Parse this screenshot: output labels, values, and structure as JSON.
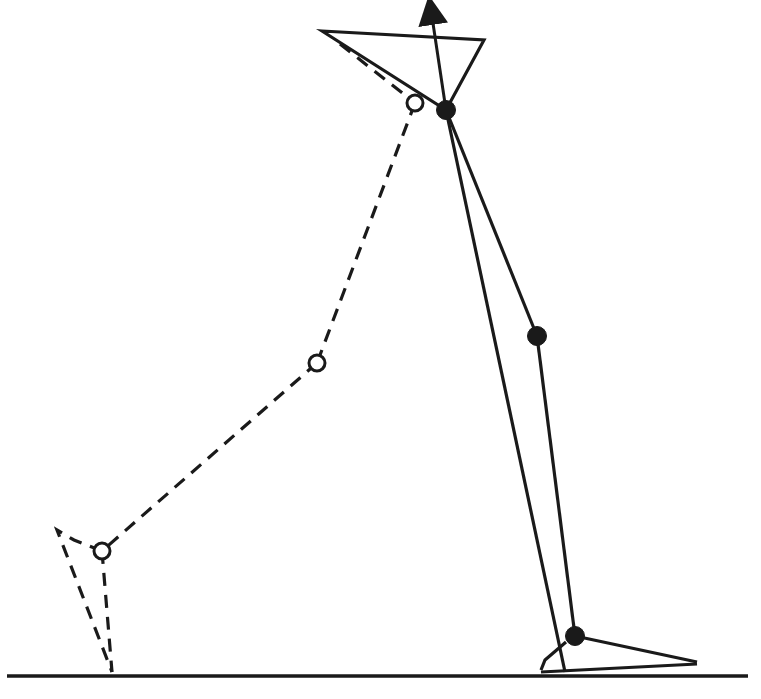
{
  "diagram": {
    "title": "",
    "colors": {
      "stroke": "#1a1a1a",
      "background": "#ffffff",
      "open_joint_fill": "#ffffff"
    },
    "ground": {
      "x1": 7,
      "y1": 676,
      "x2": 748,
      "y2": 676
    },
    "pelvis": {
      "points": [
        [
          322,
          31
        ],
        [
          484,
          40
        ],
        [
          446,
          110
        ]
      ],
      "arrow": {
        "from": [
          446,
          110
        ],
        "to": [
          431,
          4
        ]
      }
    },
    "solid_leg": {
      "hip": [
        446,
        110
      ],
      "knee": [
        537,
        336
      ],
      "ankle": [
        575,
        636
      ],
      "heel_contact": [
        565,
        672
      ],
      "toe": [
        697,
        662
      ],
      "heel_back": [
        [
          541,
          670
        ],
        [
          545,
          660
        ],
        [
          566,
          642
        ]
      ],
      "sole": [
        [
          541,
          672
        ],
        [
          697,
          664
        ]
      ]
    },
    "dashed_leg": {
      "hip": [
        415,
        103
      ],
      "knee": [
        317,
        363
      ],
      "ankle": [
        102,
        551
      ],
      "toe_contact": [
        112,
        672
      ],
      "foot_tip": [
        [
          57,
          530
        ],
        [
          74,
          540
        ]
      ],
      "pelvis_edge": [
        [
          340,
          44
        ],
        [
          415,
          103
        ]
      ]
    },
    "joints": [
      {
        "name": "solid-hip",
        "pos": [
          446,
          110
        ],
        "style": "filled"
      },
      {
        "name": "solid-knee",
        "pos": [
          537,
          336
        ],
        "style": "filled"
      },
      {
        "name": "solid-ankle",
        "pos": [
          575,
          636
        ],
        "style": "filled"
      },
      {
        "name": "dashed-hip",
        "pos": [
          415,
          103
        ],
        "style": "open"
      },
      {
        "name": "dashed-knee",
        "pos": [
          317,
          363
        ],
        "style": "open"
      },
      {
        "name": "dashed-ankle",
        "pos": [
          102,
          551
        ],
        "style": "open"
      }
    ]
  }
}
